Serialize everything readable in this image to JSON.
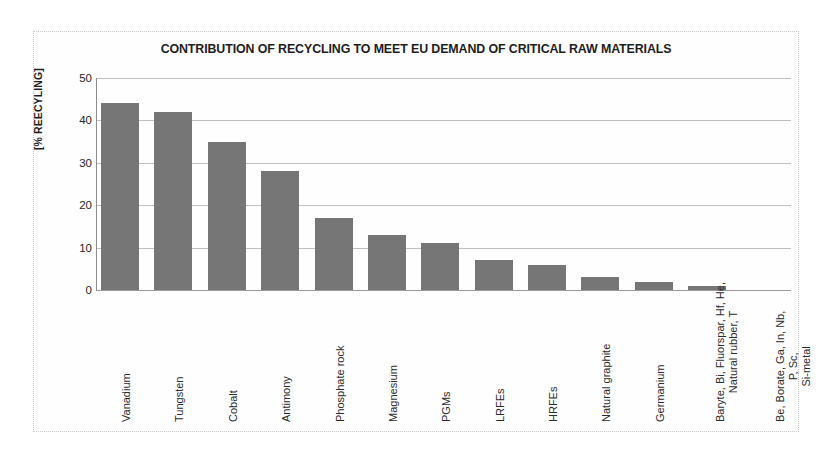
{
  "chart_data": {
    "type": "bar",
    "title": "CONTRIBUTION OF RECYCLING TO MEET EU DEMAND OF CRITICAL RAW MATERIALS",
    "xlabel": "",
    "ylabel": "[% REECYLING]",
    "ylim": [
      0,
      50
    ],
    "yticks": [
      0,
      10,
      20,
      30,
      40,
      50
    ],
    "grid": true,
    "legend": false,
    "bar_color": "#767676",
    "categories": [
      "Vanadium",
      "Tungsten",
      "Cobalt",
      "Antimony",
      "Phosphate rock",
      "Magnesium",
      "PGMs",
      "LRFEs",
      "HRFEs",
      "Natural graphite",
      "Germanium",
      "Baryte, Bi, Fluorspar, Hf, He, Natural rubber, T",
      "Be, Borate, Ga, In, Nb, P, Sc, Si-metal"
    ],
    "category_lines": [
      [
        "Vanadium"
      ],
      [
        "Tungsten"
      ],
      [
        "Cobalt"
      ],
      [
        "Antimony"
      ],
      [
        "Phosphate rock"
      ],
      [
        "Magnesium"
      ],
      [
        "PGMs"
      ],
      [
        "LRFEs"
      ],
      [
        "HRFEs"
      ],
      [
        "Natural graphite"
      ],
      [
        "Germanium"
      ],
      [
        "Baryte, Bi, Fluorspar, Hf, He,",
        "Natural rubber, T"
      ],
      [
        "Be, Borate, Ga, In, Nb,",
        "P, Sc,",
        "Si-metal"
      ]
    ],
    "values": [
      44,
      42,
      35,
      28,
      17,
      13,
      11,
      7,
      6,
      3,
      2,
      1,
      0
    ]
  }
}
